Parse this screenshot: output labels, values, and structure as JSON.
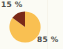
{
  "figure": {
    "background_color": "#fbfbf4",
    "width": 63,
    "height": 49
  },
  "labels": {
    "slice_0": "15 %",
    "slice_1": "85 %",
    "text_color": "#3b3b38"
  },
  "chart_data": {
    "type": "pie",
    "title": "",
    "subtitle": "",
    "xlabel": "",
    "ylabel": "",
    "grid": false,
    "legend": "none",
    "start_angle_deg": 90,
    "direction": "counterclockwise",
    "categories": [
      "15 %",
      "85 %"
    ],
    "values": [
      15,
      85
    ],
    "total": 100,
    "units": "percent",
    "colors": [
      "#7a2a18",
      "#f9c052"
    ],
    "edge_color": "#f9c052",
    "annotations": [
      "15 %",
      "85 %"
    ],
    "slices": [
      {
        "label": "15 %",
        "value": 15,
        "percent": 15,
        "color": "#7a2a18",
        "start_angle_deg": 90,
        "end_angle_deg": 144,
        "label_position": "top-left"
      },
      {
        "label": "85 %",
        "value": 85,
        "percent": 85,
        "color": "#f9c052",
        "start_angle_deg": 144,
        "end_angle_deg": 450,
        "label_position": "bottom-right"
      }
    ]
  }
}
